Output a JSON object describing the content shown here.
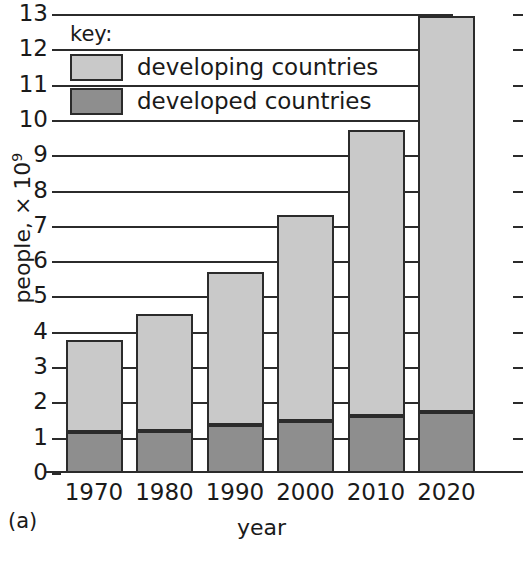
{
  "caption": "(a)",
  "legend": {
    "title": "key:",
    "items": [
      {
        "label": "developing countries",
        "color": "#c9c9c9",
        "swatch": "developing"
      },
      {
        "label": "developed countries",
        "color": "#8e8e8e",
        "swatch": "developed"
      }
    ]
  },
  "axes": {
    "y_title_text": "people, ",
    "y_title_mult": "× 10",
    "y_title_exp": "9",
    "x_title": "year",
    "y_ticks": [
      "0",
      "1",
      "2",
      "3",
      "4",
      "5",
      "6",
      "7",
      "8",
      "9",
      "10",
      "11",
      "12",
      "13"
    ]
  },
  "chart_data": {
    "type": "bar",
    "title": "",
    "subtitle": "",
    "stacked": true,
    "categories": [
      "1970",
      "1980",
      "1990",
      "2000",
      "2010",
      "2020"
    ],
    "series": [
      {
        "name": "developed countries",
        "color": "#8e8e8e",
        "values": [
          1.15,
          1.2,
          1.37,
          1.48,
          1.62,
          1.72
        ]
      },
      {
        "name": "developing countries",
        "color": "#c9c9c9",
        "values": [
          2.55,
          3.25,
          4.26,
          5.77,
          8.03,
          11.18
        ]
      }
    ],
    "totals": [
      3.7,
      4.45,
      5.63,
      7.25,
      9.65,
      12.9
    ],
    "xlabel": "year",
    "ylabel": "people, × 10⁹",
    "ylim": [
      0,
      13
    ],
    "yticks": [
      0,
      1,
      2,
      3,
      4,
      5,
      6,
      7,
      8,
      9,
      10,
      11,
      12,
      13
    ],
    "grid": true,
    "legend_position": "top-left",
    "annotations": [
      "(a)"
    ]
  }
}
